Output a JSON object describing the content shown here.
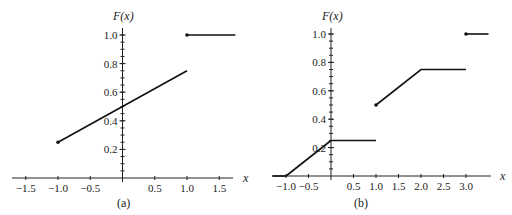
{
  "chart_data": [
    {
      "id": "a",
      "type": "line",
      "caption": "(a)",
      "title": "",
      "xlabel": "x",
      "ylabel": "F(x)",
      "xlim": [
        -1.7,
        1.75
      ],
      "ylim": [
        0,
        1.05
      ],
      "x_ticks": [
        -1.5,
        -1.0,
        -0.5,
        0.5,
        1.0,
        1.5
      ],
      "x_tick_labels": [
        "−1.5",
        "−1.0",
        "−0.5",
        "0.5",
        "1.0",
        "1.5"
      ],
      "y_ticks": [
        0.2,
        0.4,
        0.6,
        0.8,
        1.0
      ],
      "y_tick_labels": [
        "0.2",
        "0.4",
        "0.6",
        "0.8",
        "1.0"
      ],
      "grid": false,
      "series": [
        {
          "name": "segment-1",
          "x": [
            -1.0,
            1.0
          ],
          "y": [
            0.25,
            0.75
          ],
          "closed_left": true
        },
        {
          "name": "segment-2",
          "x": [
            1.0,
            1.75
          ],
          "y": [
            1.0,
            1.0
          ],
          "closed_left": true
        }
      ],
      "pixel": {
        "x0": 122.5,
        "xs": 64.5,
        "y0": 178,
        "ys": 143,
        "xmin_px": 12,
        "xmax_px": 233,
        "ytop_px": 22
      },
      "label_pos": {
        "ylabel": [
          113,
          20
        ],
        "xlabel": [
          243,
          182
        ],
        "caption": [
          117,
          207
        ]
      }
    },
    {
      "id": "b",
      "type": "line",
      "caption": "(b)",
      "title": "",
      "xlabel": "x",
      "ylabel": "F(x)",
      "xlim": [
        -1.3,
        3.5
      ],
      "ylim": [
        0,
        1.05
      ],
      "x_ticks": [
        -1.0,
        -0.5,
        0.5,
        1.0,
        1.5,
        2.0,
        2.5,
        3.0
      ],
      "x_tick_labels": [
        "−1.0",
        "−0.5",
        "0.5",
        "1.0",
        "1.5",
        "2.0",
        "2.5",
        "3.0"
      ],
      "y_ticks": [
        0.2,
        0.4,
        0.6,
        0.8,
        1.0
      ],
      "y_tick_labels": [
        "0.2",
        "0.4",
        "0.6",
        "0.8",
        "1.0"
      ],
      "grid": false,
      "series": [
        {
          "name": "segment-0",
          "x": [
            -1.3,
            -1.0
          ],
          "y": [
            0,
            0
          ],
          "closed_left": false
        },
        {
          "name": "segment-1",
          "x": [
            -1.0,
            0.0
          ],
          "y": [
            0,
            0.25
          ],
          "closed_left": false
        },
        {
          "name": "segment-2",
          "x": [
            0.0,
            1.0
          ],
          "y": [
            0.25,
            0.25
          ],
          "closed_left": false
        },
        {
          "name": "segment-3",
          "x": [
            1.0,
            2.0,
            3.0
          ],
          "y": [
            0.5,
            0.75,
            0.75
          ],
          "closed_left": true
        },
        {
          "name": "segment-4",
          "x": [
            3.0,
            3.5
          ],
          "y": [
            1.0,
            1.0
          ],
          "closed_left": true
        }
      ],
      "pixel": {
        "x0": 331,
        "xs": 45,
        "y0": 176,
        "ys": 142,
        "xmin_px": 272,
        "xmax_px": 491,
        "ytop_px": 22
      },
      "label_pos": {
        "ylabel": [
          322,
          20
        ],
        "xlabel": [
          500,
          180
        ],
        "caption": [
          354,
          207
        ]
      }
    }
  ]
}
